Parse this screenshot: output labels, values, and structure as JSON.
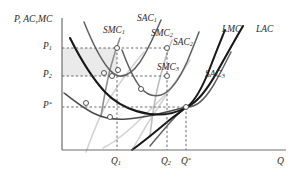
{
  "figure": {
    "type": "economics-cost-curve-diagram",
    "background_color": "#ffffff"
  },
  "axes": {
    "y_title": "P, AC,MC",
    "x_title": "Q",
    "axis_color": "#6e6e6e",
    "origin_px": [
      62,
      150
    ],
    "x_end_px": [
      286,
      150
    ],
    "y_end_px": [
      62,
      18
    ]
  },
  "y_ticks": [
    {
      "id": "P1",
      "label_html": "P<sub>1</sub>",
      "y_px": 48
    },
    {
      "id": "P2",
      "label_html": "P<sub>2</sub>",
      "y_px": 76
    },
    {
      "id": "Pstar",
      "label_html": "P<sup>*</sup>",
      "y_px": 107
    }
  ],
  "x_ticks": [
    {
      "id": "Q1",
      "label_html": "Q<sub>1</sub>",
      "x_px": 117
    },
    {
      "id": "Q2",
      "label_html": "Q<sub>2</sub>",
      "x_px": 167
    },
    {
      "id": "Qstar",
      "label_html": "Q<sup>*</sup>",
      "x_px": 186
    }
  ],
  "curve_labels": [
    {
      "id": "SMC1",
      "label_html": "SMC<sub>1</sub>",
      "x_px": 103,
      "y_px": 26
    },
    {
      "id": "SAC1",
      "label_html": "SAC<sub>1</sub>",
      "x_px": 137,
      "y_px": 14
    },
    {
      "id": "SMC2",
      "label_html": "SMC<sub>2</sub>",
      "x_px": 151,
      "y_px": 29
    },
    {
      "id": "SAC2",
      "label_html": "SAC<sub>2</sub>",
      "x_px": 173,
      "y_px": 38
    },
    {
      "id": "SMC3",
      "label_html": "SMC<sub>3</sub>",
      "x_px": 157,
      "y_px": 63
    },
    {
      "id": "SAC3",
      "label_html": "SAC<sub>3</sub>",
      "x_px": 205,
      "y_px": 70
    },
    {
      "id": "LMC",
      "label_html": "LMC",
      "x_px": 222,
      "y_px": 25
    },
    {
      "id": "LAC",
      "label_html": "LAC",
      "x_px": 256,
      "y_px": 25
    }
  ],
  "shaded_region": {
    "name": "profit-rectangle",
    "fill": "#d9d9d9",
    "opacity": 0.55,
    "x_px": 62,
    "y_px": 48,
    "width_px": 55,
    "height_px": 28
  },
  "chart_data": {
    "type": "line",
    "title": "",
    "xlabel": "Q",
    "ylabel": "P, AC,MC",
    "grid": false,
    "legend": "inline-curve-labels",
    "axis_ranges": {
      "x": [
        0,
        1
      ],
      "y": [
        0,
        1
      ]
    },
    "marked_levels": {
      "prices": [
        "P1",
        "P2",
        "P*"
      ],
      "quantities": [
        "Q1",
        "Q2",
        "Q*"
      ]
    },
    "series": [
      {
        "name": "LAC",
        "style": "dark-thick",
        "color": "#1d1d1d",
        "description": "long-run average cost, U-shaped, minimum at Q*, P*"
      },
      {
        "name": "LMC",
        "style": "dark-thick",
        "color": "#1d1d1d",
        "description": "long-run marginal cost, rising, crosses LAC at its minimum Q*"
      },
      {
        "name": "SAC1",
        "style": "medium",
        "color": "#555555",
        "description": "short-run average cost plant 1, tangent to LAC left of Q*"
      },
      {
        "name": "SMC1",
        "style": "medium",
        "color": "#7a7a7a",
        "description": "short-run marginal cost plant 1, crosses SAC1 at its minimum"
      },
      {
        "name": "SAC2",
        "style": "medium",
        "color": "#555555",
        "description": "short-run average cost plant 2, tangent to LAC between Q1 and Q*"
      },
      {
        "name": "SMC2",
        "style": "medium",
        "color": "#b5b5b5",
        "description": "short-run marginal cost plant 2"
      },
      {
        "name": "SAC3",
        "style": "medium",
        "color": "#555555",
        "description": "short-run average cost plant 3, tangent to LAC at its minimum Q*"
      },
      {
        "name": "SMC3",
        "style": "light",
        "color": "#c9c9c9",
        "description": "short-run marginal cost plant 3, passes through Q*, P*"
      }
    ],
    "markers": [
      {
        "name": "P1-on-SMC1",
        "x_px": 117,
        "y_px": 48
      },
      {
        "name": "P1-on-SMC2",
        "x_px": 167,
        "y_px": 48
      },
      {
        "name": "P2-on-SAC1-min",
        "x_px": 112,
        "y_px": 76
      },
      {
        "name": "P2-on-LAC",
        "x_px": 104,
        "y_px": 73
      },
      {
        "name": "P2-on-SMC2",
        "x_px": 167,
        "y_px": 76
      },
      {
        "name": "SAC1-LAC-tangency",
        "x_px": 117,
        "y_px": 70
      },
      {
        "name": "mid-SAC2-point",
        "x_px": 141,
        "y_px": 89
      },
      {
        "name": "Pstar-tangency",
        "x_px": 186,
        "y_px": 107
      },
      {
        "name": "lower-left-point",
        "x_px": 86,
        "y_px": 103
      },
      {
        "name": "Q1-lower-point",
        "x_px": 117,
        "y_px": 117
      },
      {
        "name": "Pstar-left-curve",
        "x_px": 103,
        "y_px": 110
      }
    ]
  }
}
